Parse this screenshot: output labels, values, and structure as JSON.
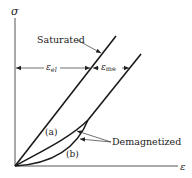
{
  "diagram": {
    "y_axis_label": "σ",
    "x_axis_label": "ε",
    "saturated_label": "Saturated",
    "demagnetized_label": "Demagnetized",
    "curve_a_label": "(a)",
    "curve_b_label": "(b)",
    "eps_el_symbol": "ε",
    "eps_el_sub": "el",
    "eps_me_symbol": "ε",
    "eps_me_sub": "me",
    "colors": {
      "line": "#1a1a1a",
      "axis": "#555555",
      "text": "#222222"
    }
  }
}
